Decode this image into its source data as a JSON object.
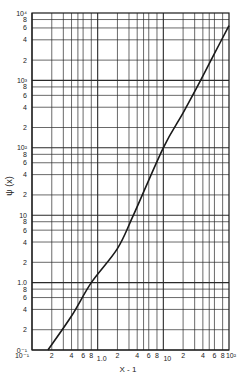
{
  "chart_data": {
    "type": "line",
    "title": "",
    "xlabel": "X - 1",
    "ylabel": "ψ (x)",
    "xscale": "log",
    "yscale": "log",
    "xlim": [
      0.1,
      100
    ],
    "ylim": [
      0.1,
      10000
    ],
    "grid": true,
    "x_major_ticks": [
      {
        "value": 0.1,
        "label": "10⁻¹"
      },
      {
        "value": 1,
        "label": "1.0"
      },
      {
        "value": 10,
        "label": "10"
      },
      {
        "value": 100,
        "label": "10²"
      }
    ],
    "x_minor_ticks": [
      2,
      4,
      6,
      8
    ],
    "y_major_ticks": [
      {
        "value": 0.1,
        "label": "0⁻¹"
      },
      {
        "value": 1,
        "label": "1.0"
      },
      {
        "value": 10,
        "label": "10"
      },
      {
        "value": 100,
        "label": "10²"
      },
      {
        "value": 1000,
        "label": "10³"
      },
      {
        "value": 10000,
        "label": "10⁴"
      }
    ],
    "y_minor_ticks": [
      2,
      4,
      6,
      8
    ],
    "series": [
      {
        "name": "ψ(x)",
        "x": [
          0.175,
          0.4,
          0.8,
          2,
          3.5,
          10,
          20,
          37,
          60,
          100
        ],
        "y": [
          0.1,
          0.32,
          1.0,
          3.2,
          10,
          100,
          330,
          1000,
          2500,
          6500
        ]
      }
    ]
  },
  "colors": {
    "ink": "#1a1a1a",
    "grid": "#2a2a2a",
    "background": "#ffffff"
  }
}
